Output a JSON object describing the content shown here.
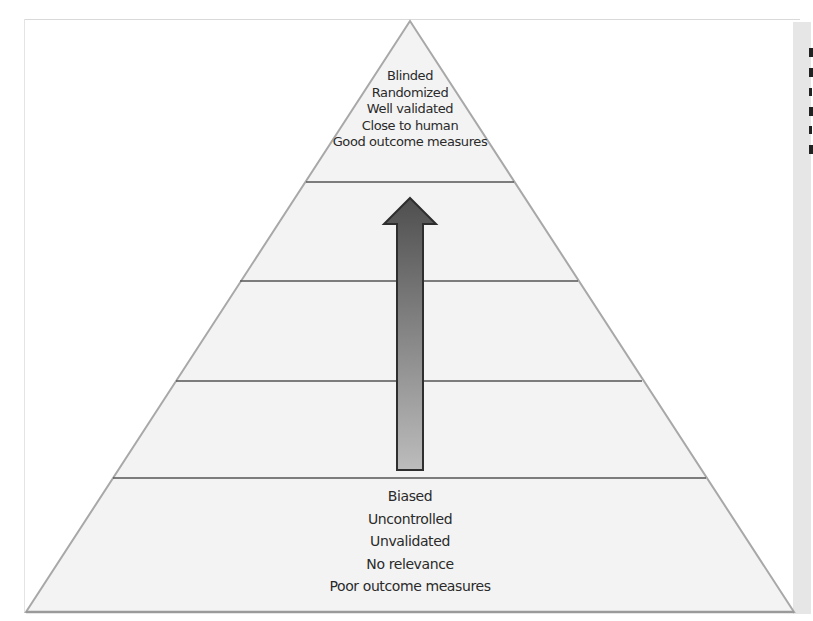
{
  "figure": {
    "type": "evidence-quality-pyramid",
    "tiers": 5,
    "top_tier": {
      "lines": [
        "Blinded",
        "Randomized",
        "Well validated",
        "Close to human",
        "Good outcome measures"
      ]
    },
    "bottom_tier": {
      "lines": [
        "Biased",
        "Uncontrolled",
        "Unvalidated",
        "No relevance",
        "Poor outcome measures"
      ]
    },
    "arrow": {
      "direction": "up",
      "gradient_top": "#4f4f4f",
      "gradient_bottom": "#b8b8b8",
      "outline": "#2e2e2e"
    },
    "colors": {
      "pyramid_fill": "#f3f3f3",
      "pyramid_edge": "#a8a8a8",
      "divider": "#555555",
      "side_strip": "#e6e6e6"
    }
  }
}
